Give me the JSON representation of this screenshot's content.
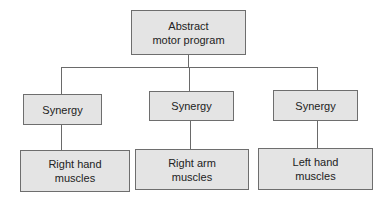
{
  "diagram": {
    "root": {
      "label_line1": "Abstract",
      "label_line2": "motor program"
    },
    "synergies": [
      {
        "label": "Synergy"
      },
      {
        "label": "Synergy"
      },
      {
        "label": "Synergy"
      }
    ],
    "muscles": [
      {
        "label_line1": "Right hand",
        "label_line2": "muscles"
      },
      {
        "label_line1": "Right arm",
        "label_line2": "muscles"
      },
      {
        "label_line1": "Left hand",
        "label_line2": "muscles"
      }
    ],
    "colors": {
      "box_fill": "#e4e4e4",
      "box_border": "#6e6e6e",
      "line": "#6a6a6a"
    }
  }
}
